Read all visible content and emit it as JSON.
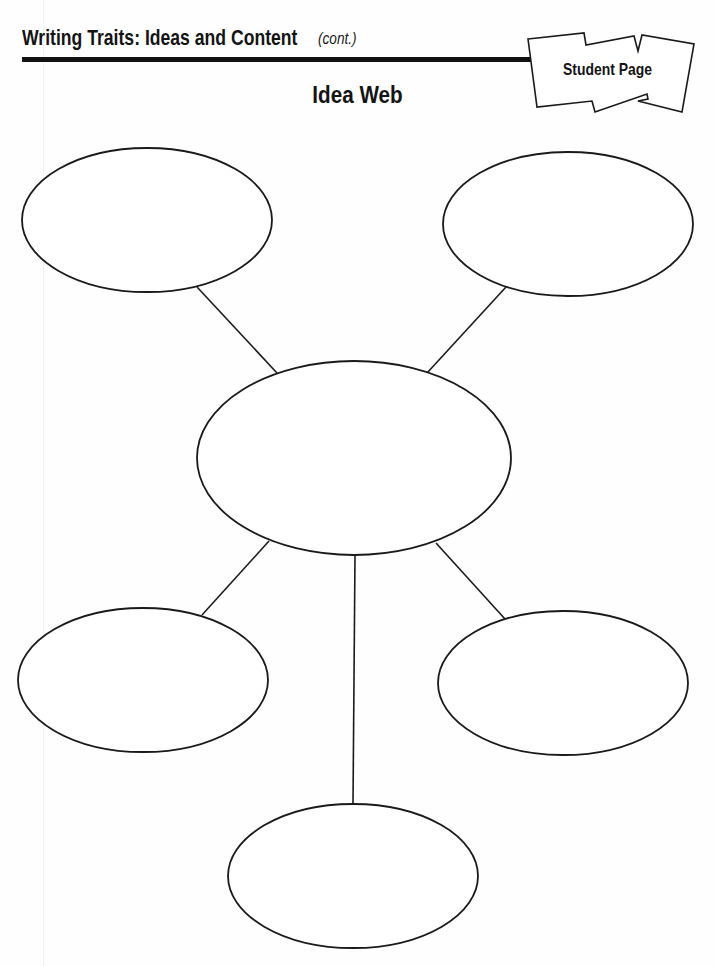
{
  "header": {
    "title": "Writing Traits: Ideas and Content",
    "continued": "(cont.)"
  },
  "badge": {
    "label": "Student Page"
  },
  "organizer": {
    "title": "Idea Web",
    "type": "idea-web",
    "stroke_color": "#1a1a1a",
    "nodes": [
      {
        "id": "center",
        "label": "",
        "cx": 354,
        "cy": 458,
        "rx": 157,
        "ry": 97
      },
      {
        "id": "top-left",
        "label": "",
        "cx": 147,
        "cy": 220,
        "rx": 125,
        "ry": 72
      },
      {
        "id": "top-right",
        "label": "",
        "cx": 568,
        "cy": 224,
        "rx": 125,
        "ry": 72
      },
      {
        "id": "bottom-left",
        "label": "",
        "cx": 143,
        "cy": 680,
        "rx": 125,
        "ry": 72
      },
      {
        "id": "bottom-right",
        "label": "",
        "cx": 563,
        "cy": 683,
        "rx": 125,
        "ry": 72
      },
      {
        "id": "bottom",
        "label": "",
        "cx": 353,
        "cy": 876,
        "rx": 125,
        "ry": 72
      }
    ]
  }
}
